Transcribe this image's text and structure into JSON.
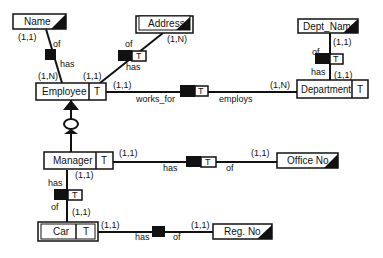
{
  "diagram": {
    "entities": {
      "employee": {
        "label": "Employee",
        "tag": "T"
      },
      "department": {
        "label": "Department",
        "tag": "T"
      },
      "manager": {
        "label": "Manager",
        "tag": "T"
      },
      "car": {
        "label": "Car",
        "tag": "T"
      }
    },
    "attributes": {
      "name": {
        "label": "Name"
      },
      "address": {
        "label": "Address"
      },
      "dept_name": {
        "label": "Dept_Name"
      },
      "office_no": {
        "label": "Office No."
      },
      "reg_no": {
        "label": "Reg. No"
      }
    },
    "relationships": {
      "emp_name": {
        "role_a": "has",
        "role_b": "of",
        "card_entity": "(1,N)",
        "card_attr": "(1,1)"
      },
      "emp_address": {
        "role_a": "has",
        "role_b": "of",
        "tag": "T",
        "card_entity": "(1,1)",
        "card_attr": "(1,N)"
      },
      "works_for": {
        "role_a": "works_for",
        "role_b": "employs",
        "tag": "T",
        "card_employee": "(1,1)",
        "card_department": "(1,N)"
      },
      "dept_name": {
        "role_a": "has",
        "role_b": "of",
        "tag": "T",
        "card_entity": "(1,1)",
        "card_attr": "(1,1)"
      },
      "mgr_office": {
        "role_a": "has",
        "role_b": "of",
        "tag": "T",
        "card_entity": "(1,1)",
        "card_attr": "(1,1)"
      },
      "mgr_car": {
        "role_a": "has",
        "role_b": "of",
        "tag": "T",
        "card_manager": "(1,1)",
        "card_car": "(1,1)"
      },
      "car_reg": {
        "role_a": "has",
        "role_b": "of",
        "card_entity": "(1,1)",
        "card_attr": "(1,1)"
      }
    }
  }
}
